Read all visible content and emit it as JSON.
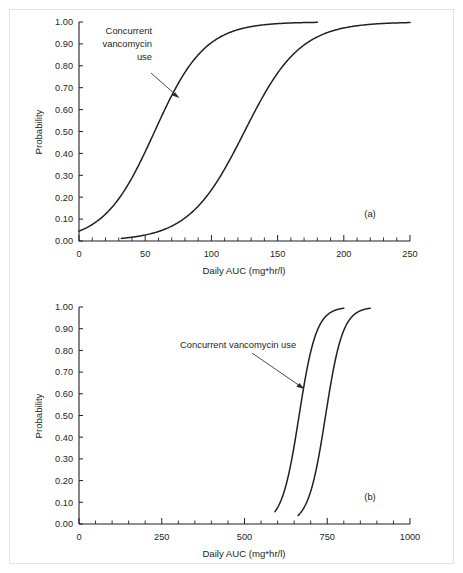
{
  "figure": {
    "panels": [
      {
        "tag": "(a)",
        "annotation": [
          "Concurrent",
          "vancomycin",
          "use"
        ],
        "annotation_text": "Concurrent vancomycin use"
      },
      {
        "tag": "(b)",
        "annotation": [
          "Concurrent vancomycin use"
        ],
        "annotation_text": "Concurrent vancomycin use"
      }
    ]
  },
  "chart_data": [
    {
      "type": "line",
      "panel": "(a)",
      "title": "",
      "xlabel": "Daily AUC (mg*hr/l)",
      "ylabel": "Probability",
      "xlim": [
        0,
        250
      ],
      "ylim": [
        0,
        1
      ],
      "xticks": [
        0,
        50,
        100,
        150,
        200,
        250
      ],
      "xtick_labels": [
        "0",
        "50",
        "100",
        "150",
        "200",
        "250"
      ],
      "xminor_step": 10,
      "yticks": [
        0.0,
        0.1,
        0.2,
        0.3,
        0.4,
        0.5,
        0.6,
        0.7,
        0.8,
        0.9,
        1.0
      ],
      "ytick_labels": [
        "0.00",
        "0.10",
        "0.20",
        "0.30",
        "0.40",
        "0.50",
        "0.60",
        "0.70",
        "0.80",
        "0.90",
        "1.00"
      ],
      "grid": false,
      "legend": "none",
      "annotations": [
        {
          "text": "Concurrent vancomycin use",
          "lines": [
            "Concurrent",
            "vancomycin",
            "use"
          ],
          "points_to_series": "With concurrent vancomycin use",
          "target_x": 62,
          "target_y": 0.7
        }
      ],
      "series": [
        {
          "name": "With concurrent vancomycin use",
          "model": "logistic",
          "x50": 57,
          "slope_scale": 19,
          "y_at_x0": 0.045,
          "x_start": 0,
          "x_end": 180,
          "x": [
            0,
            10,
            20,
            30,
            40,
            50,
            57,
            60,
            70,
            80,
            90,
            100,
            110,
            120,
            130,
            140,
            150,
            160,
            170,
            180
          ],
          "y": [
            0.045,
            0.077,
            0.129,
            0.208,
            0.317,
            0.451,
            0.545,
            0.584,
            0.704,
            0.8,
            0.872,
            0.921,
            0.952,
            0.972,
            0.984,
            0.991,
            0.995,
            0.997,
            0.998,
            0.999
          ]
        },
        {
          "name": "Without concurrent vancomycin use",
          "model": "logistic",
          "x50": 125,
          "slope_scale": 21,
          "y_at_x0": 0.0,
          "x_start": 32,
          "x_end": 250,
          "x": [
            32,
            40,
            50,
            60,
            70,
            80,
            90,
            100,
            110,
            120,
            125,
            130,
            140,
            150,
            160,
            170,
            180,
            200,
            220,
            250
          ],
          "y": [
            0.011,
            0.016,
            0.026,
            0.042,
            0.066,
            0.102,
            0.154,
            0.225,
            0.315,
            0.421,
            0.476,
            0.532,
            0.638,
            0.732,
            0.809,
            0.868,
            0.911,
            0.961,
            0.984,
            0.996
          ]
        }
      ]
    },
    {
      "type": "line",
      "panel": "(b)",
      "title": "",
      "xlabel": "Daily AUC (mg*hr/l)",
      "ylabel": "Probability",
      "xlim": [
        0,
        1000
      ],
      "ylim": [
        0,
        1
      ],
      "xticks": [
        0,
        250,
        500,
        750,
        1000
      ],
      "xtick_labels": [
        "0",
        "250",
        "500",
        "750",
        "1000"
      ],
      "xminor_step": 50,
      "yticks": [
        0.0,
        0.1,
        0.2,
        0.3,
        0.4,
        0.5,
        0.6,
        0.7,
        0.8,
        0.9,
        1.0
      ],
      "ytick_labels": [
        "0.00",
        "0.10",
        "0.20",
        "0.30",
        "0.40",
        "0.50",
        "0.60",
        "0.70",
        "0.80",
        "0.90",
        "1.00"
      ],
      "grid": false,
      "legend": "none",
      "annotations": [
        {
          "text": "Concurrent vancomycin use",
          "lines": [
            "Concurrent vancomycin use"
          ],
          "points_to_series": "With concurrent vancomycin use",
          "target_x": 645,
          "target_y": 0.7
        }
      ],
      "series": [
        {
          "name": "With concurrent vancomycin use",
          "model": "logistic",
          "x50": 665,
          "slope_scale": 26,
          "y_at_x0": 0.0,
          "x_start": 592,
          "x_end": 800,
          "x": [
            592,
            610,
            620,
            630,
            640,
            650,
            660,
            665,
            670,
            680,
            690,
            700,
            710,
            720,
            740,
            760,
            780,
            800
          ],
          "y": [
            0.006,
            0.012,
            0.018,
            0.026,
            0.038,
            0.055,
            0.079,
            0.094,
            0.111,
            0.152,
            0.204,
            0.268,
            0.342,
            0.423,
            0.59,
            0.735,
            0.842,
            0.91
          ]
        },
        {
          "name": "Without concurrent vancomycin use",
          "model": "logistic",
          "x50": 745,
          "slope_scale": 26,
          "y_at_x0": 0.0,
          "x_start": 662,
          "x_end": 880,
          "x": [
            662,
            680,
            690,
            700,
            710,
            720,
            730,
            740,
            745,
            750,
            760,
            770,
            780,
            800,
            820,
            850,
            880
          ],
          "y": [
            0.005,
            0.011,
            0.016,
            0.024,
            0.035,
            0.05,
            0.072,
            0.102,
            0.12,
            0.141,
            0.192,
            0.255,
            0.33,
            0.492,
            0.65,
            0.83,
            0.925
          ]
        }
      ]
    }
  ]
}
